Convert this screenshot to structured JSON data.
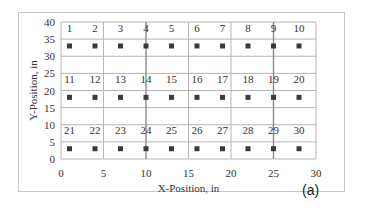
{
  "chart_data": {
    "type": "scatter",
    "title": "",
    "xlabel": "X-Position, in",
    "ylabel": "Y-Position, in",
    "xlim": [
      0,
      30
    ],
    "ylim": [
      0,
      40
    ],
    "xticks": [
      0,
      5,
      10,
      15,
      20,
      25,
      30
    ],
    "yticks": [
      0,
      5,
      10,
      15,
      20,
      25,
      30,
      35,
      40
    ],
    "grid": true,
    "legend": null,
    "marker": "square",
    "marker_color": "#3a3a3a",
    "points": [
      {
        "label": "1",
        "x": 1,
        "y": 33
      },
      {
        "label": "2",
        "x": 4,
        "y": 33
      },
      {
        "label": "3",
        "x": 7,
        "y": 33
      },
      {
        "label": "4",
        "x": 10,
        "y": 33
      },
      {
        "label": "5",
        "x": 13,
        "y": 33
      },
      {
        "label": "6",
        "x": 16,
        "y": 33
      },
      {
        "label": "7",
        "x": 19,
        "y": 33
      },
      {
        "label": "8",
        "x": 22,
        "y": 33
      },
      {
        "label": "9",
        "x": 25,
        "y": 33
      },
      {
        "label": "10",
        "x": 28,
        "y": 33
      },
      {
        "label": "11",
        "x": 1,
        "y": 18
      },
      {
        "label": "12",
        "x": 4,
        "y": 18
      },
      {
        "label": "13",
        "x": 7,
        "y": 18
      },
      {
        "label": "14",
        "x": 10,
        "y": 18
      },
      {
        "label": "15",
        "x": 13,
        "y": 18
      },
      {
        "label": "16",
        "x": 16,
        "y": 18
      },
      {
        "label": "17",
        "x": 19,
        "y": 18
      },
      {
        "label": "18",
        "x": 22,
        "y": 18
      },
      {
        "label": "19",
        "x": 25,
        "y": 18
      },
      {
        "label": "20",
        "x": 28,
        "y": 18
      },
      {
        "label": "21",
        "x": 1,
        "y": 3
      },
      {
        "label": "22",
        "x": 4,
        "y": 3
      },
      {
        "label": "23",
        "x": 7,
        "y": 3
      },
      {
        "label": "24",
        "x": 10,
        "y": 3
      },
      {
        "label": "25",
        "x": 13,
        "y": 3
      },
      {
        "label": "26",
        "x": 16,
        "y": 3
      },
      {
        "label": "27",
        "x": 19,
        "y": 3
      },
      {
        "label": "28",
        "x": 22,
        "y": 3
      },
      {
        "label": "29",
        "x": 25,
        "y": 3
      },
      {
        "label": "30",
        "x": 28,
        "y": 3
      }
    ],
    "annotations": [
      "(a)"
    ]
  },
  "panel_label": "(a)"
}
